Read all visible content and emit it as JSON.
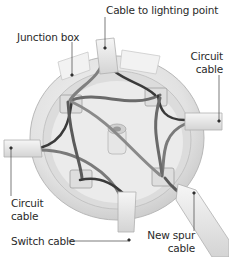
{
  "diagram": {
    "labels": {
      "lighting": "Cable to lighting point",
      "junction": "Junction box",
      "circuit_right_1": "Circuit",
      "circuit_right_2": "cable",
      "circuit_left_1": "Circuit",
      "circuit_left_2": "cable",
      "switch": "Switch cable",
      "spur_1": "New spur",
      "spur_2": "cable"
    },
    "colors": {
      "box_body": "#e9e9e9",
      "box_shadow": "#bdbdbd",
      "wire_dark": "#3a3a3a",
      "wire_grey": "#7a7a7a",
      "leader": "#444444",
      "text": "#2a2a2a"
    }
  }
}
